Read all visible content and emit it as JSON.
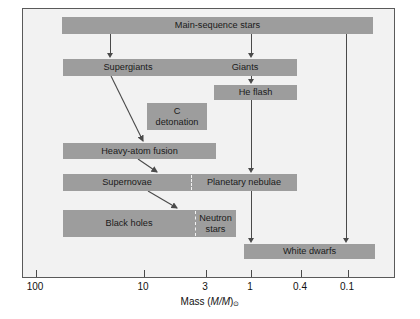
{
  "figure": {
    "kind": "stellar-evolution-flow-diagram",
    "background_color": "#f2f2f2",
    "box_color": "#9d9d9d",
    "line_color": "#4a4a4a"
  },
  "nodes": [
    {
      "id": "main-sequence-stars",
      "label": "Main-sequence stars",
      "x": 39,
      "y": 8,
      "w": 311,
      "h": 17
    },
    {
      "id": "supergiants-giants",
      "label": "",
      "x": 40,
      "y": 50,
      "w": 234,
      "h": 17,
      "segments": [
        {
          "id": "supergiants",
          "label": "Supergiants",
          "offset": 0,
          "width": 130
        },
        {
          "id": "giants",
          "label": "Giants",
          "offset": 130,
          "width": 104
        }
      ]
    },
    {
      "id": "he-flash",
      "label": "He flash",
      "x": 191,
      "y": 76,
      "w": 83,
      "h": 15
    },
    {
      "id": "c-detonation",
      "label": "C\ndetonation",
      "x": 124,
      "y": 94,
      "w": 60,
      "h": 27
    },
    {
      "id": "heavy-atom-fusion",
      "label": "Heavy-atom fusion",
      "x": 40,
      "y": 134,
      "w": 153,
      "h": 16
    },
    {
      "id": "supernovae-planetary-nebulae",
      "label": "",
      "x": 40,
      "y": 165,
      "w": 234,
      "h": 17,
      "segments": [
        {
          "id": "supernovae",
          "label": "Supernovae",
          "offset": 0,
          "width": 128
        },
        {
          "id": "planetary-nebulae",
          "label": "Planetary nebulae",
          "offset": 128,
          "width": 106
        }
      ],
      "divider": 128
    },
    {
      "id": "black-holes-neutron-stars",
      "label": "",
      "x": 40,
      "y": 201,
      "w": 173,
      "h": 27,
      "segments": [
        {
          "id": "black-holes",
          "label": "Black holes",
          "offset": 0,
          "width": 132
        },
        {
          "id": "neutron-stars",
          "label": "Neutron\nstars",
          "offset": 132,
          "width": 41
        }
      ],
      "divider": 132
    },
    {
      "id": "white-dwarfs",
      "label": "White dwarfs",
      "x": 221,
      "y": 235,
      "w": 131,
      "h": 15
    }
  ],
  "connectors": [
    {
      "id": "ms-to-supergiants",
      "type": "vertical",
      "x": 87,
      "y1": 25,
      "y2": 49
    },
    {
      "id": "ms-to-giants",
      "type": "vertical",
      "x": 228,
      "y1": 25,
      "y2": 49
    },
    {
      "id": "ms-to-white-dwarfs",
      "type": "vertical",
      "x": 323,
      "y1": 25,
      "y2": 234
    },
    {
      "id": "giants-to-he-flash",
      "type": "vertical",
      "x": 228,
      "y1": 67,
      "y2": 75
    },
    {
      "id": "he-flash-to-planetary",
      "type": "vertical",
      "x": 228,
      "y1": 91,
      "y2": 164
    },
    {
      "id": "planetary-to-white-dwarfs",
      "type": "vertical",
      "x": 228,
      "y1": 182,
      "y2": 234
    },
    {
      "id": "supergiants-to-heavy-atom-fusion",
      "type": "diagonal",
      "x1": 88,
      "y1": 67,
      "x2": 120,
      "y2": 132
    },
    {
      "id": "heavy-atom-fusion-to-supernovae",
      "type": "diagonal",
      "x1": 115,
      "y1": 150,
      "x2": 134,
      "y2": 163
    },
    {
      "id": "supernovae-to-neutron-stars",
      "type": "diagonal",
      "x1": 125,
      "y1": 182,
      "x2": 154,
      "y2": 199
    }
  ],
  "axis": {
    "title_prefix": "Mass (",
    "title_var": "M/M",
    "title_symbol": "⊙",
    "title_suffix": ")",
    "ticks": [
      {
        "label": "100",
        "x": 13
      },
      {
        "label": "10",
        "x": 121
      },
      {
        "label": "3",
        "x": 183
      },
      {
        "label": "1",
        "x": 228
      },
      {
        "label": "0.4",
        "x": 278
      },
      {
        "label": "0.1",
        "x": 325
      }
    ]
  }
}
